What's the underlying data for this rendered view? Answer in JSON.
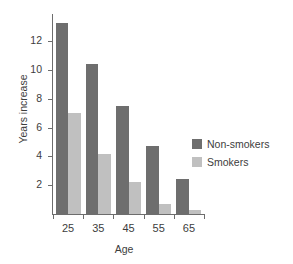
{
  "chart_data": {
    "type": "bar",
    "title": "",
    "subtitle": "",
    "xlabel": "Age",
    "ylabel": "Years increase",
    "categories": [
      "25",
      "35",
      "45",
      "55",
      "65"
    ],
    "series": [
      {
        "name": "Non-smokers",
        "color": "#6e6e6e",
        "values": [
          13.3,
          10.4,
          7.5,
          4.7,
          2.4
        ]
      },
      {
        "name": "Smokers",
        "color": "#c0c0c0",
        "values": [
          7.0,
          4.2,
          2.2,
          0.7,
          0.3
        ]
      }
    ],
    "ylim": [
      0,
      13.9
    ],
    "yticks": [
      2,
      4,
      6,
      8,
      10,
      12
    ],
    "yticklabels": [
      "2",
      "4",
      "6",
      "8",
      "10",
      "12"
    ],
    "xticklabels": [
      "25",
      "35",
      "45",
      "55",
      "65"
    ],
    "grid": false,
    "legend_position": "right",
    "annotations": []
  },
  "legend": {
    "entries": [
      {
        "label": "Non-smokers"
      },
      {
        "label": "Smokers"
      }
    ]
  }
}
